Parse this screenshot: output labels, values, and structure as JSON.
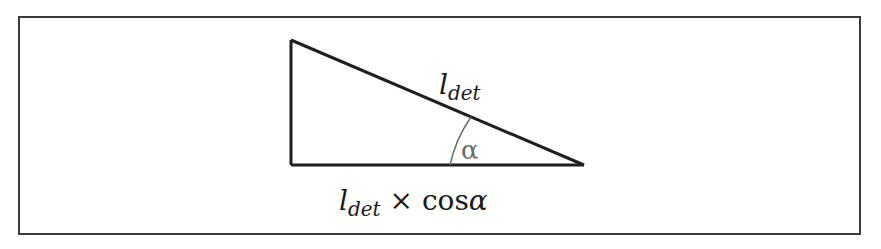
{
  "diagram": {
    "type": "right-triangle",
    "hypotenuse_label": {
      "base": "l",
      "subscript": "det"
    },
    "angle_label": "α",
    "base_label": {
      "base": "l",
      "subscript": "det",
      "operator": " × ",
      "function": "cos",
      "argument": "α"
    },
    "colors": {
      "stroke": "#1e1e1e",
      "frame": "#3a3a3a",
      "arc": "#6b6b6b",
      "background": "#ffffff"
    }
  }
}
